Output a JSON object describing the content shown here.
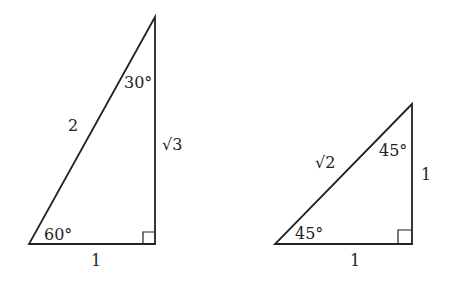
{
  "triangles": [
    {
      "name": "30-60-90",
      "vertices": {
        "top": [
          155,
          17
        ],
        "bottom_left": [
          29,
          244
        ],
        "bottom_right": [
          155,
          244
        ]
      },
      "hypotenuse_label": "2",
      "vertical_leg_label": "√3",
      "base_label": "1",
      "top_angle": "30°",
      "bottom_angle": "60°"
    },
    {
      "name": "45-45-90",
      "vertices": {
        "top": [
          412,
          104
        ],
        "bottom_left": [
          275,
          244
        ],
        "bottom_right": [
          412,
          244
        ]
      },
      "hypotenuse_label": "√2",
      "vertical_leg_label": "1",
      "base_label": "1",
      "top_angle": "45°",
      "bottom_angle": "45°"
    }
  ],
  "colors": {
    "stroke": "#222222",
    "background": "#ffffff"
  }
}
